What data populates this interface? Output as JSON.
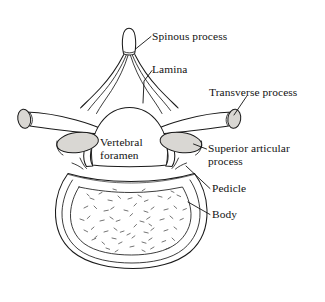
{
  "figure": {
    "kind": "anatomical-illustration",
    "background_color": "#ffffff",
    "ink_color": "#1a1a1a",
    "shaded_fill_color": "#d9d7d3",
    "width": 325,
    "height": 302
  },
  "labels": {
    "spinous_process": "Spinous process",
    "lamina": "Lamina",
    "transverse_process": "Transverse process",
    "vertebral_foramen_line1": "Vertebral",
    "vertebral_foramen_line2": "foramen",
    "superior_articular_line1": "Superior articular",
    "superior_articular_line2": "process",
    "pedicle": "Pedicle",
    "body": "Body"
  }
}
